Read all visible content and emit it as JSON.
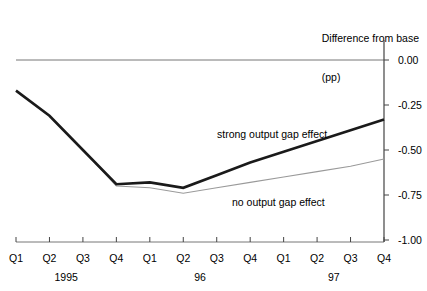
{
  "chart_data": {
    "type": "line",
    "title": "",
    "axis_title": "Difference from base",
    "axis_title_unit": "(pp)",
    "ylabel": "",
    "xlabel": "",
    "ylim": [
      -1.0,
      0.0
    ],
    "yticks": [
      "0.00",
      "-0.25",
      "-0.50",
      "-0.75",
      "-1.00"
    ],
    "ytick_values": [
      0.0,
      -0.25,
      -0.5,
      -0.75,
      -1.0
    ],
    "grid": false,
    "zero_line": true,
    "legend_position": "inline-annotations",
    "categories": [
      "Q1",
      "Q2",
      "Q3",
      "Q4",
      "Q1",
      "Q2",
      "Q3",
      "Q4",
      "Q1",
      "Q2",
      "Q3",
      "Q4"
    ],
    "year_groups": [
      {
        "label": "1995",
        "center_index": 1.5
      },
      {
        "label": "96",
        "center_index": 5.5
      },
      {
        "label": "97",
        "center_index": 9.5
      }
    ],
    "series": [
      {
        "name": "strong output gap effect",
        "color": "#1a1a1a",
        "width": 2.6,
        "values": [
          -0.17,
          -0.31,
          -0.5,
          -0.69,
          -0.68,
          -0.71,
          -0.64,
          -0.57,
          -0.51,
          -0.45,
          -0.39,
          -0.33
        ]
      },
      {
        "name": "no output gap effect",
        "color": "#9a9a9a",
        "width": 1.1,
        "values": [
          -0.17,
          -0.31,
          -0.5,
          -0.7,
          -0.71,
          -0.74,
          -0.71,
          -0.68,
          -0.65,
          -0.62,
          -0.59,
          -0.55
        ]
      }
    ]
  }
}
